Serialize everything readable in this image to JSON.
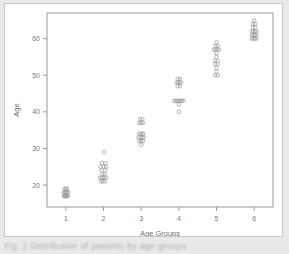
{
  "figure": {
    "caption": "Fig. 2   Distribution of patients by age groups",
    "background_color": "#e9e9e9",
    "card_color": "#ffffff",
    "point_color": "#9d9d9d",
    "axis_color": "#9a9a9a"
  },
  "chart_data": {
    "type": "scatter",
    "title": "",
    "xlabel": "Age Groups",
    "ylabel": "Age",
    "xlim": [
      0.5,
      6.5
    ],
    "ylim": [
      14,
      67
    ],
    "xticks": [
      1,
      2,
      3,
      4,
      5,
      6
    ],
    "xticklabels": [
      "1",
      "2",
      "3",
      "4",
      "5",
      "6"
    ],
    "yticks": [
      20,
      30,
      40,
      50,
      60
    ],
    "yticklabels": [
      "20",
      "30",
      "40",
      "50",
      "60"
    ],
    "grid": false,
    "legend": null,
    "marker": "open-circle",
    "series": [
      {
        "name": "Age Group 1",
        "x_category": 1,
        "values": [
          17,
          17,
          17,
          17,
          17,
          17,
          17,
          17,
          18,
          18,
          18,
          18,
          18,
          18,
          19,
          19,
          19
        ],
        "x_jitter": [
          -0.05,
          -0.02,
          0.0,
          0.02,
          0.05,
          -0.03,
          0.03,
          0.0,
          -0.06,
          -0.03,
          0.0,
          0.03,
          0.06,
          0.0,
          -0.03,
          0.0,
          0.03
        ]
      },
      {
        "name": "Age Group 2",
        "x_category": 2,
        "values": [
          21,
          21,
          21,
          22,
          22,
          22,
          22,
          23,
          23,
          24,
          24,
          25,
          25,
          25,
          26,
          26,
          29
        ],
        "x_jitter": [
          -0.07,
          -0.02,
          0.04,
          -0.09,
          -0.04,
          0.02,
          0.07,
          -0.03,
          0.03,
          -0.05,
          0.05,
          -0.08,
          0.0,
          0.07,
          -0.04,
          0.05,
          0.02
        ]
      },
      {
        "name": "Age Group 3",
        "x_category": 3,
        "values": [
          31,
          32,
          32,
          32,
          33,
          33,
          33,
          33,
          34,
          34,
          34,
          34,
          37,
          37,
          37,
          38,
          38
        ],
        "x_jitter": [
          0.0,
          -0.05,
          0.0,
          0.05,
          -0.07,
          -0.02,
          0.03,
          0.07,
          -0.06,
          -0.02,
          0.03,
          0.06,
          -0.05,
          0.0,
          0.05,
          -0.03,
          0.03
        ]
      },
      {
        "name": "Age Group 4",
        "x_category": 4,
        "values": [
          40,
          42,
          43,
          43,
          43,
          43,
          43,
          43,
          43,
          47,
          47,
          48,
          48,
          48,
          48,
          49,
          49
        ],
        "x_jitter": [
          0.0,
          0.0,
          -0.12,
          -0.08,
          -0.04,
          0.0,
          0.04,
          0.08,
          0.12,
          -0.03,
          0.03,
          -0.06,
          -0.02,
          0.02,
          0.06,
          -0.03,
          0.03
        ]
      },
      {
        "name": "Age Group 5",
        "x_category": 5,
        "values": [
          50,
          50,
          51,
          52,
          53,
          53,
          54,
          54,
          55,
          56,
          57,
          57,
          57,
          57,
          58,
          58,
          59
        ],
        "x_jitter": [
          -0.04,
          0.03,
          0.0,
          0.0,
          -0.04,
          0.03,
          -0.04,
          0.03,
          0.0,
          0.0,
          -0.07,
          -0.03,
          0.02,
          0.06,
          -0.03,
          0.03,
          0.0
        ]
      },
      {
        "name": "Age Group 6",
        "x_category": 6,
        "values": [
          60,
          60,
          60,
          60,
          61,
          61,
          61,
          61,
          62,
          62,
          62,
          62,
          63,
          63,
          64,
          64,
          65
        ],
        "x_jitter": [
          -0.06,
          -0.02,
          0.02,
          0.06,
          -0.06,
          -0.02,
          0.02,
          0.06,
          -0.06,
          -0.02,
          0.02,
          0.06,
          -0.03,
          0.03,
          -0.03,
          0.03,
          0.0
        ]
      }
    ]
  }
}
